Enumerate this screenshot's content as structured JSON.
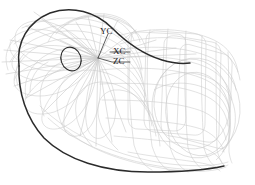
{
  "figure": {
    "background_color": "#ffffff",
    "width": 255,
    "height": 185
  },
  "colors": {
    "mesh_light": "#c9c9c9",
    "mesh_mid": "#b0b0b0",
    "highlight_curve": "#2b2b2b",
    "label_text": "#1a1a1a"
  },
  "coordinate_system": {
    "name": "work-coordinate-system",
    "origin": {
      "x": 98,
      "y": 58
    },
    "axes": [
      {
        "id": "yc",
        "label": "YC",
        "label_x": 100,
        "label_y": 27,
        "leader_from": {
          "x": 98,
          "y": 58
        },
        "leader_to": {
          "x": 107,
          "y": 30
        }
      },
      {
        "id": "xc",
        "label": "XC",
        "label_x": 113,
        "label_y": 47,
        "leader_from": {
          "x": 98,
          "y": 58
        },
        "leader_to": {
          "x": 130,
          "y": 52
        }
      },
      {
        "id": "zc",
        "label": "ZC",
        "label_x": 113,
        "label_y": 57,
        "leader_from": {
          "x": 98,
          "y": 58
        },
        "leader_to": {
          "x": 130,
          "y": 63
        }
      }
    ]
  },
  "geometry": {
    "highlight_curve_name": "dark-boundary-curve",
    "inner_ellipse": {
      "cx": 71,
      "cy": 59,
      "rx": 10,
      "ry": 12,
      "rotation": -18
    },
    "mesh_description": "faint grey surface isoparametric curves",
    "stroke_widths": {
      "mesh": 0.55,
      "highlight": 1.5,
      "leader": 0.6
    }
  }
}
